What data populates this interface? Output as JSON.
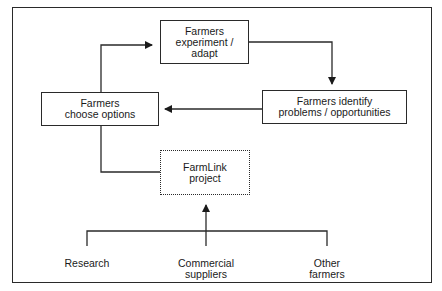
{
  "diagram": {
    "nodes": {
      "experiment": {
        "line1": "Farmers",
        "line2": "experiment /",
        "line3": "adapt"
      },
      "identify": {
        "line1": "Farmers identify",
        "line2": "problems / opportunities"
      },
      "choose": {
        "line1": "Farmers",
        "line2": "choose options"
      },
      "farmlink": {
        "line1": "FarmLink",
        "line2": "project"
      }
    },
    "sources": {
      "research": {
        "line1": "Research"
      },
      "commercial": {
        "line1": "Commercial",
        "line2": "suppliers"
      },
      "other": {
        "line1": "Other",
        "line2": "farmers"
      }
    },
    "edges": [
      {
        "from": "choose",
        "to": "experiment",
        "arrow": true
      },
      {
        "from": "experiment",
        "to": "identify",
        "arrow": true
      },
      {
        "from": "identify",
        "to": "choose",
        "arrow": true
      },
      {
        "from": "choose",
        "to": "farmlink",
        "arrow": false
      },
      {
        "from": "sources",
        "to": "farmlink",
        "arrow": true
      }
    ],
    "colors": {
      "line": "#2a2a2a",
      "background": "#ffffff"
    }
  }
}
